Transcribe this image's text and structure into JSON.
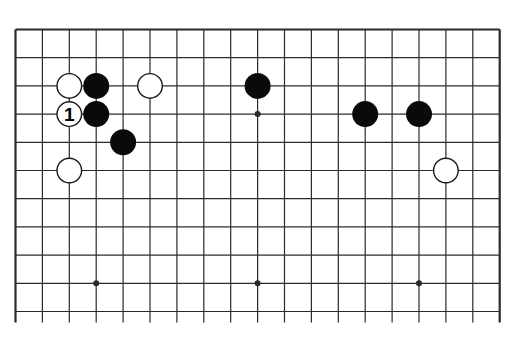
{
  "diagram": {
    "type": "go-board-partial",
    "board_size": 19,
    "visible_rows": 11,
    "colors": {
      "background": "#ffffff",
      "line": "#2a2a2a",
      "black_stone": "#0a0a0a",
      "white_stone_fill": "#ffffff",
      "white_stone_stroke": "#1a1a1a"
    },
    "geometry": {
      "origin_x": 15.5,
      "origin_y": 29.5,
      "col_spacing": 26.9,
      "row_spacing": 28.2,
      "line_extend_bottom": 11,
      "stone_radius": 13
    },
    "star_points": [
      {
        "col": 3,
        "row": 3
      },
      {
        "col": 9,
        "row": 3
      },
      {
        "col": 15,
        "row": 3
      },
      {
        "col": 3,
        "row": 9
      },
      {
        "col": 9,
        "row": 9
      },
      {
        "col": 15,
        "row": 9
      }
    ],
    "stones": [
      {
        "color": "white",
        "col": 2,
        "row": 2,
        "label": ""
      },
      {
        "color": "black",
        "col": 3,
        "row": 2,
        "label": ""
      },
      {
        "color": "white",
        "col": 5,
        "row": 2,
        "label": ""
      },
      {
        "color": "black",
        "col": 9,
        "row": 2,
        "label": ""
      },
      {
        "color": "white",
        "col": 2,
        "row": 3,
        "label": "1"
      },
      {
        "color": "black",
        "col": 3,
        "row": 3,
        "label": ""
      },
      {
        "color": "black",
        "col": 4,
        "row": 4,
        "label": ""
      },
      {
        "color": "white",
        "col": 2,
        "row": 5,
        "label": ""
      },
      {
        "color": "black",
        "col": 13,
        "row": 3,
        "label": ""
      },
      {
        "color": "black",
        "col": 15,
        "row": 3,
        "label": ""
      },
      {
        "color": "white",
        "col": 16,
        "row": 5,
        "label": ""
      }
    ],
    "move_label": "1"
  }
}
